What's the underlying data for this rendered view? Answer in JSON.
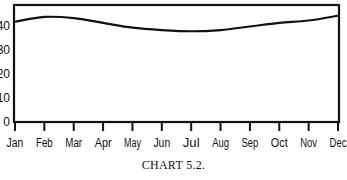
{
  "chart_data": {
    "type": "line",
    "title": "",
    "caption": "CHART 5.2.",
    "xlabel": "",
    "ylabel": "",
    "categories": [
      "Jan",
      "Feb",
      "Mar",
      "Apr",
      "May",
      "Jun",
      "Jul",
      "Aug",
      "Sep",
      "Oct",
      "Nov",
      "Dec"
    ],
    "series": [
      {
        "name": "series-1",
        "values": [
          42,
          44,
          43.5,
          41.5,
          39.5,
          38.5,
          38,
          38.5,
          40,
          41.5,
          42.5,
          44.5
        ]
      }
    ],
    "yticks": [
      0,
      10,
      20,
      30,
      40
    ],
    "ylim": [
      0,
      49
    ],
    "grid": false,
    "legend": "none"
  },
  "colors": {
    "line": "#111111",
    "axis": "#111111"
  }
}
